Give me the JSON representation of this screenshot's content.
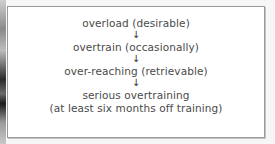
{
  "diagram": {
    "type": "vertical-flow",
    "steps": [
      {
        "label": "overload (desirable)"
      },
      {
        "label": "overtrain (occasionally)"
      },
      {
        "label": "over-reaching (retrievable)"
      },
      {
        "label": "serious overtraining",
        "sublabel": "(at least six months off training)"
      }
    ],
    "arrow_glyph": "↓"
  }
}
